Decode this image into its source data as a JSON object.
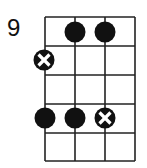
{
  "diagram": {
    "type": "ukulele-chord-chart",
    "start_fret": "9",
    "strings": 4,
    "frets": 5,
    "notes": [
      {
        "string": 2,
        "fret": 1,
        "marker": "dot"
      },
      {
        "string": 3,
        "fret": 1,
        "marker": "dot"
      },
      {
        "string": 1,
        "fret": 2,
        "marker": "x-dot"
      },
      {
        "string": 1,
        "fret": 4,
        "marker": "dot"
      },
      {
        "string": 2,
        "fret": 4,
        "marker": "dot"
      },
      {
        "string": 3,
        "fret": 4,
        "marker": "x-dot"
      }
    ],
    "colors": {
      "line": "#222222",
      "dot": "#111111",
      "x": "#ffffff"
    }
  }
}
